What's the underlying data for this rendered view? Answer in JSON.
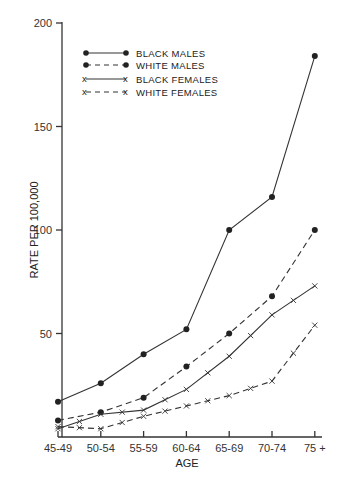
{
  "chart_data": {
    "type": "line",
    "title": "",
    "xlabel": "AGE",
    "ylabel": "RATE PER 100,000",
    "categories": [
      "45-49",
      "50-54",
      "55-59",
      "60-64",
      "65-69",
      "70-74",
      "75 +"
    ],
    "ylim": [
      0,
      200
    ],
    "yticks": [
      50,
      100,
      150,
      200
    ],
    "grid": false,
    "legend_position": "upper-left",
    "series": [
      {
        "name": "BLACK MALES",
        "marker": "dot",
        "line": "solid",
        "values": [
          17,
          26,
          40,
          52,
          100,
          116,
          184
        ]
      },
      {
        "name": "WHITE MALES",
        "marker": "dot",
        "line": "dashed",
        "values": [
          8,
          12,
          19,
          34,
          50,
          68,
          100
        ]
      },
      {
        "name": "BLACK FEMALES",
        "marker": "x",
        "line": "solid",
        "values": [
          4,
          11,
          13,
          23,
          39,
          59,
          73
        ]
      },
      {
        "name": "WHITE FEMALES",
        "marker": "x",
        "line": "dashed",
        "values": [
          5,
          4,
          10,
          15,
          20,
          27,
          54
        ]
      }
    ]
  },
  "axes": {
    "x_title": "AGE",
    "y_title": "RATE PER 100,000",
    "y_tick_labels": [
      "50",
      "100",
      "150",
      "200"
    ],
    "x_tick_labels": [
      "45-49",
      "50-54",
      "55-59",
      "60-64",
      "65-69",
      "70-74",
      "75 +"
    ]
  },
  "legend": [
    {
      "label": "BLACK MALES"
    },
    {
      "label": "WHITE MALES"
    },
    {
      "label": "BLACK FEMALES"
    },
    {
      "label": "WHITE FEMALES"
    }
  ],
  "colors": {
    "ink": "#333333",
    "background": "#ffffff"
  }
}
